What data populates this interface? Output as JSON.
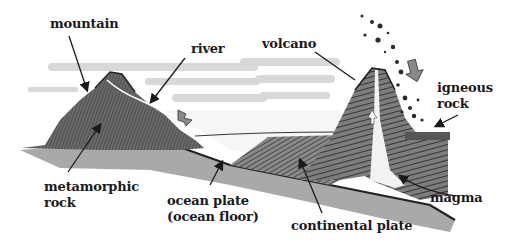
{
  "diagram": {
    "type": "geology-cross-section",
    "labels": {
      "mountain": "mountain",
      "river": "river",
      "volcano": "volcano",
      "igneous_rock_line1": "igneous",
      "igneous_rock_line2": "rock",
      "metamorphic_rock_line1": "metamorphic",
      "metamorphic_rock_line2": "rock",
      "ocean_plate_line1": "ocean plate",
      "ocean_plate_line2": "(ocean floor)",
      "continental_plate": "continental plate",
      "magma": "magma"
    },
    "colors": {
      "background": "#ffffff",
      "ink": "#1a1a1a",
      "rock_dark": "#4a4a4a",
      "rock_mid": "#7a7a7a",
      "sky_streak": "#d0d0d0",
      "water": "#f4f4f4"
    }
  }
}
